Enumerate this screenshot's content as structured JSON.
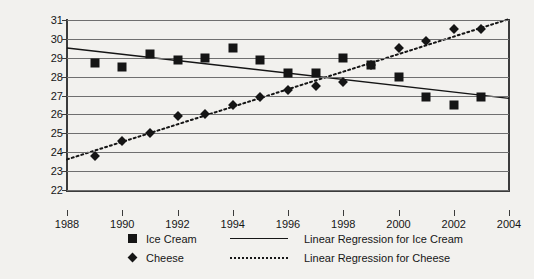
{
  "chart_data": {
    "type": "scatter",
    "title": "",
    "xlabel": "",
    "ylabel": "Per Capita Consumption (pounds)",
    "xlim": [
      1988,
      2004
    ],
    "ylim": [
      22,
      31
    ],
    "grid": true,
    "legend_position": "bottom",
    "x_ticks": [
      "1988",
      "1990",
      "1992",
      "1994",
      "1996",
      "1998",
      "2000",
      "2002",
      "2004"
    ],
    "y_ticks": [
      "22",
      "23",
      "24",
      "25",
      "26",
      "27",
      "28",
      "29",
      "30",
      "31"
    ],
    "x": [
      1989,
      1990,
      1991,
      1992,
      1993,
      1994,
      1995,
      1996,
      1997,
      1998,
      1999,
      2000,
      2001,
      2002,
      2003
    ],
    "series": [
      {
        "name": "Ice Cream",
        "marker": "square",
        "values": [
          28.7,
          28.5,
          29.2,
          28.9,
          29.0,
          29.5,
          28.9,
          28.2,
          28.2,
          29.0,
          28.6,
          28.0,
          26.9,
          26.5,
          26.9
        ]
      },
      {
        "name": "Cheese",
        "marker": "diamond",
        "values": [
          23.8,
          24.6,
          25.0,
          25.9,
          26.0,
          26.5,
          26.9,
          27.3,
          27.5,
          27.7,
          28.6,
          29.5,
          29.9,
          30.5,
          30.5
        ]
      }
    ],
    "trendlines": [
      {
        "name": "Linear Regression for Ice Cream",
        "style": "solid",
        "x0": 1988,
        "y0": 29.52,
        "x1": 2004,
        "y1": 26.85
      },
      {
        "name": "Linear Regression for Cheese",
        "style": "dotted",
        "x0": 1988,
        "y0": 23.62,
        "x1": 2004,
        "y1": 31.05
      }
    ]
  },
  "legend": {
    "items": [
      {
        "label": "Ice Cream",
        "marker": "square",
        "line_style": "solid",
        "line_label": "Linear Regression for Ice Cream"
      },
      {
        "label": "Cheese",
        "marker": "diamond",
        "line_style": "dotted",
        "line_label": "Linear Regression for Cheese"
      }
    ]
  },
  "colors": {
    "ink": "#151515",
    "grid": "#6f6f6f",
    "axis": "#3b3b3b",
    "background": "#f2f1ee"
  }
}
